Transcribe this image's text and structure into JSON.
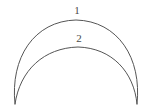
{
  "figure": {
    "kind": "crescent-lune-diagram",
    "background_color": "#ffffff",
    "stroke_color": "#555555",
    "label_color": "#4a4a4a",
    "stroke_width": 1,
    "cusps": {
      "left": {
        "x": 15,
        "y": 104
      },
      "right": {
        "x": 137,
        "y": 104
      }
    },
    "arcs": [
      {
        "id": "outer-arc",
        "label": "1",
        "label_x": 77,
        "label_y": 14,
        "apex": {
          "x": 76,
          "y": 20
        },
        "path": "M 15 104 C 10 58, 34 21, 76 20 C 118 21, 142 58, 137 104"
      },
      {
        "id": "inner-arc",
        "label": "2",
        "label_x": 79,
        "label_y": 42,
        "apex": {
          "x": 78,
          "y": 47
        },
        "path": "M 15 104 C 20 70, 44 48, 78 47 C 112 48, 134 72, 137 104"
      }
    ]
  }
}
